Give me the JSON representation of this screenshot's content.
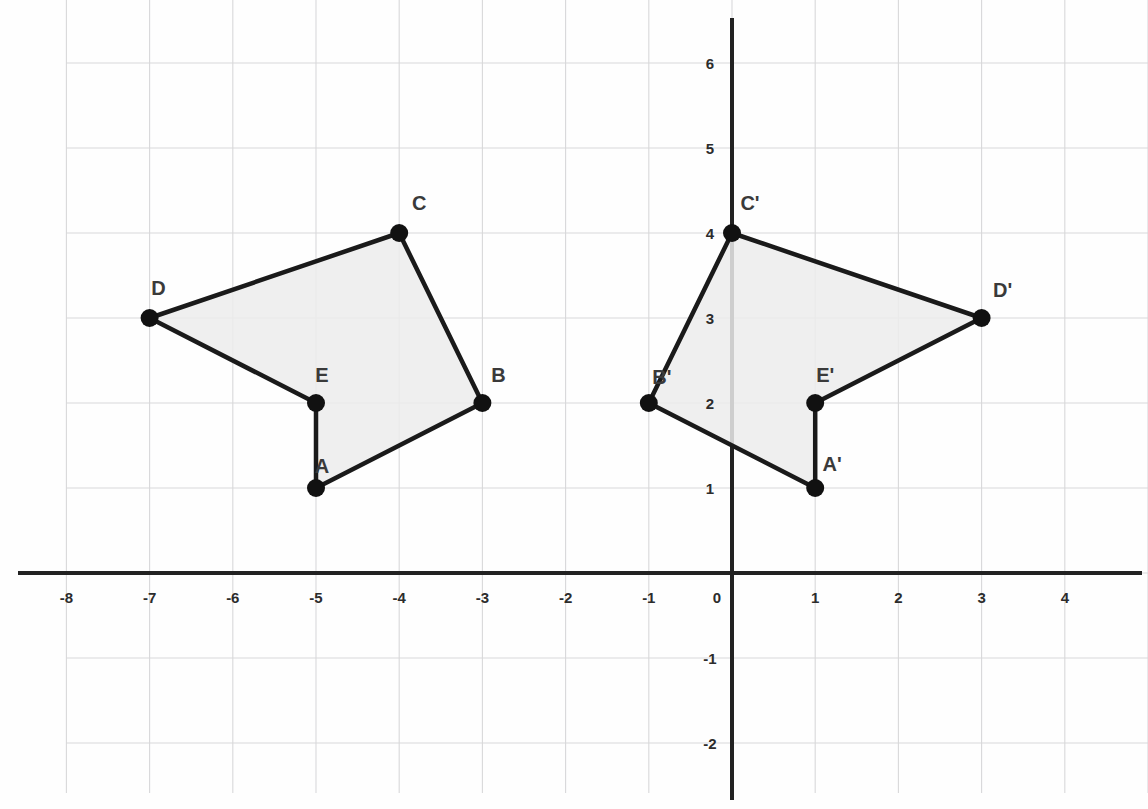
{
  "chart_data": {
    "type": "scatter",
    "title": "",
    "xlabel": "",
    "ylabel": "",
    "grid": true,
    "legend": "none",
    "xlim": [
      -8.8,
      5.0
    ],
    "ylim": [
      -2.75,
      6.75
    ],
    "x_ticks": [
      -8,
      -7,
      -6,
      -5,
      -4,
      -3,
      -2,
      -1,
      0,
      1,
      2,
      3,
      4
    ],
    "y_ticks": [
      6,
      5,
      4,
      3,
      2,
      1,
      0,
      -1,
      -2
    ],
    "x_tick_labels": [
      "-8",
      "-7",
      "-6",
      "-5",
      "-4",
      "-3",
      "-2",
      "-1",
      "0",
      "1",
      "2",
      "3",
      "4"
    ],
    "y_tick_labels": [
      "6",
      "5",
      "4",
      "3",
      "2",
      "1",
      "0",
      "-1",
      "-2"
    ],
    "series": [
      {
        "name": "ABCDE",
        "closed": true,
        "fill": "#ececec",
        "stroke": "#1a1a1a",
        "points": [
          {
            "label": "A",
            "x": -5,
            "y": 1,
            "label_dx": 6,
            "label_dy": -22
          },
          {
            "label": "B",
            "x": -3,
            "y": 2,
            "label_dx": 16,
            "label_dy": -28
          },
          {
            "label": "C",
            "x": -4,
            "y": 4,
            "label_dx": 20,
            "label_dy": -30
          },
          {
            "label": "D",
            "x": -7,
            "y": 3,
            "label_dx": 9,
            "label_dy": -30
          },
          {
            "label": "E",
            "x": -5,
            "y": 2,
            "label_dx": 6,
            "label_dy": -28
          }
        ],
        "edges": [
          [
            "A",
            "B"
          ],
          [
            "B",
            "C"
          ],
          [
            "C",
            "D"
          ],
          [
            "D",
            "E"
          ],
          [
            "E",
            "A"
          ]
        ]
      },
      {
        "name": "A'B'C'D'E'",
        "closed": true,
        "fill": "#ececec",
        "stroke": "#1a1a1a",
        "points": [
          {
            "label": "A'",
            "x": 1,
            "y": 1,
            "label_dx": 17,
            "label_dy": -24
          },
          {
            "label": "B'",
            "x": -1,
            "y": 2,
            "label_dx": 13,
            "label_dy": -26
          },
          {
            "label": "C'",
            "x": 0,
            "y": 4,
            "label_dx": 18,
            "label_dy": -30
          },
          {
            "label": "D'",
            "x": 3,
            "y": 3,
            "label_dx": 21,
            "label_dy": -28
          },
          {
            "label": "E'",
            "x": 1,
            "y": 2,
            "label_dx": 10,
            "label_dy": -28
          }
        ],
        "edges": [
          [
            "A'",
            "B'"
          ],
          [
            "B'",
            "C'"
          ],
          [
            "C'",
            "D'"
          ],
          [
            "D'",
            "E'"
          ],
          [
            "E'",
            "A'"
          ]
        ]
      }
    ],
    "colors": {
      "axis": "#222222",
      "grid": "#d8d8da",
      "fill": "#ececec",
      "stroke": "#1a1a1a",
      "vertex": "#111111",
      "label_text": "#3a3a3a",
      "tick_text": "#2c2c2c",
      "background": "#fefefe"
    },
    "geometry": {
      "origin_px_x": 732,
      "origin_px_y": 573,
      "unit_px_x": 83.2,
      "unit_px_y": 85.0,
      "grid_left_px": 66,
      "grid_right_px": 1148,
      "grid_top_px": 0,
      "grid_bottom_px": 793,
      "vertex_radius": 9,
      "edge_width": 4.5,
      "axis_width": 4
    }
  }
}
